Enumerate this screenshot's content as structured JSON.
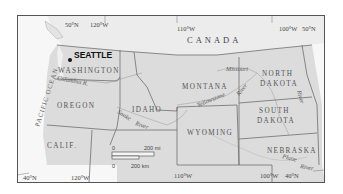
{
  "map": {
    "colors": {
      "land_us": "#dcdcdc",
      "land_canada": "#ececec",
      "ocean": "#f7f7f7",
      "border": "#6e6e6e",
      "river": "#b8b8b8",
      "frame": "#555555"
    },
    "countries": [
      {
        "name": "CANADA"
      }
    ],
    "states": [
      {
        "name": "WASHINGTON"
      },
      {
        "name": "OREGON"
      },
      {
        "name": "CALIF."
      },
      {
        "name": "IDAHO"
      },
      {
        "name": "MONTANA"
      },
      {
        "name": "WYOMING"
      },
      {
        "name": "NORTH",
        "name2": "DAKOTA"
      },
      {
        "name": "SOUTH",
        "name2": "DAKOTA"
      },
      {
        "name": "NEBRASKA"
      }
    ],
    "city": {
      "name": "SEATTLE"
    },
    "water": {
      "ocean": "PACIFIC OCEAN"
    },
    "rivers": [
      {
        "name": "Columbia R."
      },
      {
        "name": "Snake",
        "name2": "River"
      },
      {
        "name": "Yellowstone",
        "name2": "River"
      },
      {
        "name": "Missouri",
        "name2": "River"
      },
      {
        "name": "Platte",
        "name2": "River"
      }
    ],
    "graticule": {
      "top_lat": "50°N",
      "top_lon_1": "120°W",
      "top_lon_2": "110°W",
      "top_lon_3": "100°W",
      "top_lat_right": "50°N",
      "bottom_lat_left": "40°N",
      "bottom_lon_1": "120°W",
      "bottom_lon_2": "110°W",
      "bottom_lon_3": "100°W",
      "bottom_lat_right": "40°N"
    },
    "scale_bar": {
      "zero_mi": "0",
      "miles": "200 mi",
      "zero_km": "0",
      "km": "200 km"
    }
  }
}
